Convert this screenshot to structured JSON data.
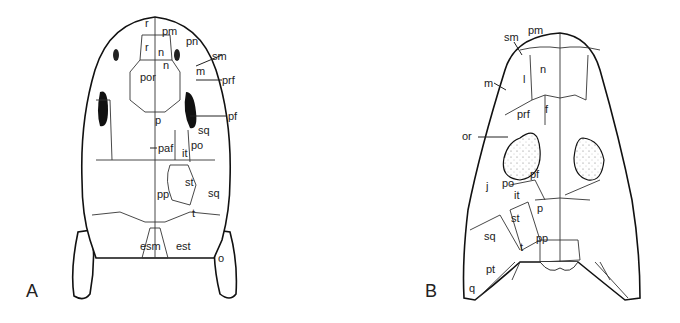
{
  "figure": {
    "panels": [
      {
        "id": "A",
        "label": "A",
        "bone_labels": {
          "r_top": "r",
          "pm": "pm",
          "pn": "pn",
          "sm": "sm",
          "m": "m",
          "prf": "prf",
          "r": "r",
          "n1": "n",
          "n2": "n",
          "por": "por",
          "pf": "pf",
          "p": "p",
          "sq1": "sq",
          "paf": "paf",
          "it": "it",
          "po": "po",
          "st": "st",
          "sq2": "sq",
          "pp": "pp",
          "t": "t",
          "esm": "esm",
          "est": "est",
          "o": "o"
        }
      },
      {
        "id": "B",
        "label": "B",
        "bone_labels": {
          "sm": "sm",
          "pm": "pm",
          "n": "n",
          "m": "m",
          "l": "l",
          "prf": "prf",
          "f": "f",
          "or": "or",
          "pf": "pf",
          "j": "j",
          "po": "po",
          "it": "it",
          "p": "p",
          "st": "st",
          "sq": "sq",
          "pp": "pp",
          "t": "t",
          "pt": "pt",
          "q": "q"
        }
      }
    ]
  }
}
